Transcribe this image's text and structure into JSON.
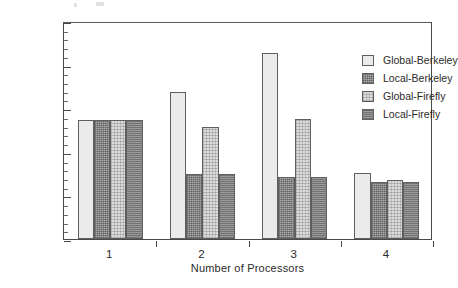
{
  "chart_data": {
    "type": "bar",
    "title": "",
    "subtitle": "",
    "xlabel": "Number of Processors",
    "ylabel": "Misses x 10",
    "ylabel_exponent": "3",
    "categories": [
      "1",
      "2",
      "3",
      "4"
    ],
    "series": [
      {
        "name": "Global-Berkeley",
        "values": [
          1370,
          1690,
          2130,
          760
        ],
        "color": "#ebebeb"
      },
      {
        "name": "Local-Berkeley",
        "values": [
          1370,
          750,
          710,
          650
        ],
        "color": "#b0b0b0"
      },
      {
        "name": "Global-Firefly",
        "values": [
          1370,
          1290,
          1380,
          680
        ],
        "color": "#dcdcdc"
      },
      {
        "name": "Local-Firefly",
        "values": [
          1370,
          750,
          710,
          650
        ],
        "color": "#9a9a9a"
      }
    ],
    "ylim": [
      0,
      2500
    ],
    "ytick_labels": [
      "0",
      "500",
      "1000",
      "1500",
      "2000",
      "2500"
    ],
    "ytick_values": [
      0,
      500,
      1000,
      1500,
      2000,
      2500
    ],
    "yminor_step": 100,
    "grid": false,
    "legend_position": "top-right-inside",
    "frame": true
  },
  "legend": {
    "entries": [
      {
        "label": "Global-Berkeley"
      },
      {
        "label": "Local-Berkeley"
      },
      {
        "label": "Global-Firefly"
      },
      {
        "label": "Local-Firefly"
      }
    ]
  }
}
